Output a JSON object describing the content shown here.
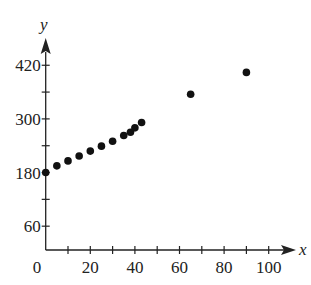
{
  "chart_data": {
    "type": "scatter",
    "title": "",
    "xlabel": "x",
    "ylabel": "y",
    "xlim": [
      0,
      110
    ],
    "ylim": [
      0,
      460
    ],
    "grid": false,
    "legend": null,
    "x_ticks": [
      10,
      20,
      30,
      40,
      50,
      60,
      70,
      80,
      90,
      100
    ],
    "x_tick_labels": [
      {
        "value": 0,
        "label": "0"
      },
      {
        "value": 20,
        "label": "20"
      },
      {
        "value": 40,
        "label": "40"
      },
      {
        "value": 60,
        "label": "60"
      },
      {
        "value": 80,
        "label": "80"
      },
      {
        "value": 100,
        "label": "100"
      }
    ],
    "y_ticks": [
      60,
      120,
      180,
      240,
      300,
      360,
      420
    ],
    "y_tick_labels": [
      {
        "value": 60,
        "label": "60"
      },
      {
        "value": 180,
        "label": "180"
      },
      {
        "value": 300,
        "label": "300"
      },
      {
        "value": 420,
        "label": "420"
      }
    ],
    "series": [
      {
        "name": "data",
        "points": [
          {
            "x": 0,
            "y": 180
          },
          {
            "x": 5,
            "y": 195
          },
          {
            "x": 10,
            "y": 206
          },
          {
            "x": 15,
            "y": 217
          },
          {
            "x": 20,
            "y": 228
          },
          {
            "x": 25,
            "y": 239
          },
          {
            "x": 30,
            "y": 250
          },
          {
            "x": 35,
            "y": 263
          },
          {
            "x": 38,
            "y": 270
          },
          {
            "x": 40,
            "y": 280
          },
          {
            "x": 43,
            "y": 292
          },
          {
            "x": 65,
            "y": 355
          },
          {
            "x": 90,
            "y": 404
          }
        ]
      }
    ]
  },
  "colors": {
    "axis": "#222222",
    "point": "#111111",
    "background": "#ffffff"
  }
}
